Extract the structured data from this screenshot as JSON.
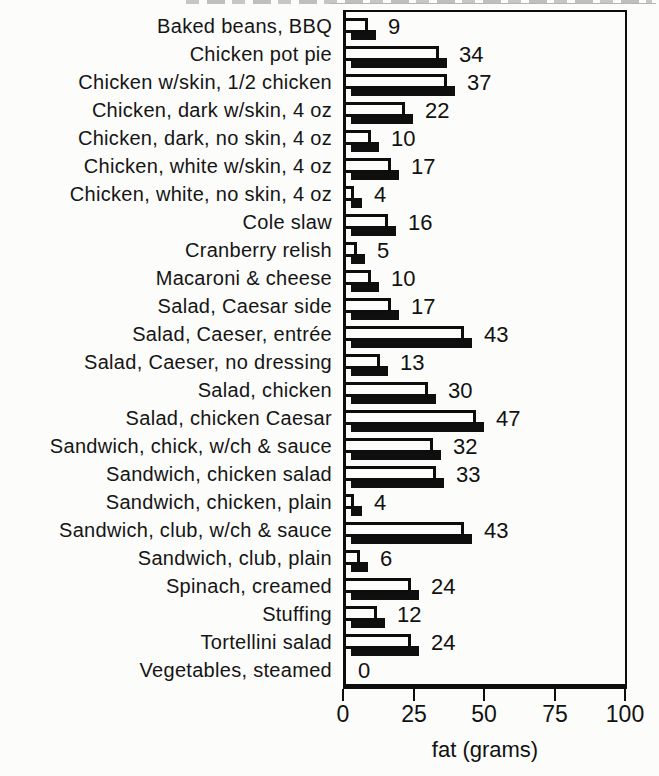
{
  "chart_data": {
    "type": "bar",
    "orientation": "horizontal",
    "categories": [
      "Baked beans, BBQ",
      "Chicken pot pie",
      "Chicken w/skin, 1/2 chicken",
      "Chicken, dark w/skin, 4 oz",
      "Chicken, dark, no skin, 4 oz",
      "Chicken, white w/skin, 4 oz",
      "Chicken, white, no skin, 4 oz",
      "Cole slaw",
      "Cranberry relish",
      "Macaroni & cheese",
      "Salad, Caesar side",
      "Salad, Caeser, entrée",
      "Salad, Caeser, no dressing",
      "Salad, chicken",
      "Salad, chicken Caesar",
      "Sandwich, chick, w/ch & sauce",
      "Sandwich, chicken salad",
      "Sandwich, chicken, plain",
      "Sandwich, club, w/ch & sauce",
      "Sandwich, club, plain",
      "Spinach, creamed",
      "Stuffing",
      "Tortellini salad",
      "Vegetables, steamed"
    ],
    "values": [
      9,
      34,
      37,
      22,
      10,
      17,
      4,
      16,
      5,
      10,
      17,
      43,
      13,
      30,
      47,
      32,
      33,
      4,
      43,
      6,
      24,
      12,
      24,
      0
    ],
    "xlabel": "fat (grams)",
    "xlim": [
      0,
      100
    ],
    "xticks": [
      0,
      25,
      50,
      75,
      100
    ],
    "grid": false,
    "legend": "none",
    "bar_fill": "#fdfdfc",
    "bar_outline": "#0d0d0d",
    "shadow_color": "#0f0f0f",
    "background": "#fcfcfb"
  }
}
